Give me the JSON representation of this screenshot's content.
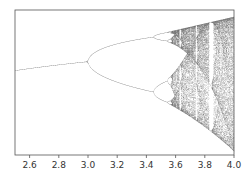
{
  "chart_data": {
    "type": "scatter",
    "title": "",
    "subtitle": "",
    "xlabel": "",
    "ylabel": "",
    "xlim": [
      2.5,
      4.0
    ],
    "ylim": [
      -0.03,
      1.05
    ],
    "x_ticks": [
      2.6,
      2.8,
      3.0,
      3.2,
      3.4,
      3.6,
      3.8,
      4.0
    ],
    "x_tick_labels": [
      "2.6",
      "2.8",
      "3.0",
      "3.2",
      "3.4",
      "3.6",
      "3.8",
      "4.0"
    ],
    "y_ticks": [],
    "grid": false,
    "legend": null,
    "series": [
      {
        "name": "logistic map attractor",
        "r_start": 2.5,
        "r_end": 4.0,
        "r_steps": 900,
        "transient_iterations": 300,
        "plotted_iterations": 120,
        "x0": 0.5,
        "point_color": "#000000"
      }
    ],
    "key_points": [
      {
        "r": 2.5,
        "x": 0.6,
        "note": "stable fixed point"
      },
      {
        "r": 3.0,
        "x": 0.667,
        "note": "period-doubling to 2-cycle"
      },
      {
        "r": 3.449,
        "note": "period-doubling to 4-cycle"
      },
      {
        "r": 3.57,
        "note": "onset of chaos"
      },
      {
        "r": 3.83,
        "note": "period-3 window"
      },
      {
        "r": 4.0,
        "x_range": [
          0,
          1
        ],
        "note": "full chaos"
      }
    ]
  },
  "colors": {
    "axis": "#555555",
    "points": "#000000",
    "background": "#ffffff"
  }
}
